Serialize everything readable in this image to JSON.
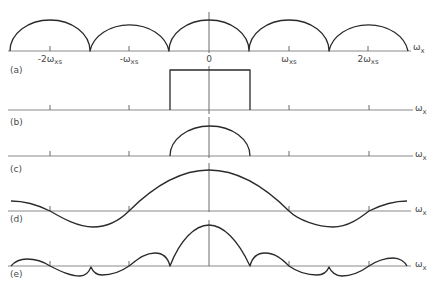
{
  "figure": {
    "background": "#ffffff",
    "line_color": "#2a2a2a",
    "axis_color": "#8a8a8a",
    "axis_label": {
      "main": "ω",
      "sub": "x"
    },
    "tick_labels": [
      {
        "main": "-2ω",
        "sub": "xs"
      },
      {
        "main": "-ω",
        "sub": "xs"
      },
      {
        "main": "0",
        "sub": ""
      },
      {
        "main": "ω",
        "sub": "xs"
      },
      {
        "main": "2ω",
        "sub": "xs"
      }
    ],
    "panels": [
      {
        "label": "(a)",
        "description": "periodic replicas of spectrum (semicircular lobes centered at multiples of ω_xs)",
        "curve": "M10,51 A40,31 0 0 1 90,51 A40,31 0 0 1 169,51 A40,31 0 0 1 249,51 A40,31 0 0 1 329,51 A40,31 0 0 1 408,51"
      },
      {
        "label": "(b)",
        "description": "ideal rectangular low-pass filter from -ω_xs/2 to ω_xs/2",
        "curve": "M170,110 L170,70 L250,70 L250,110"
      },
      {
        "label": "(c)",
        "description": "recovered baseband spectrum (single semicircular lobe)",
        "curve": "M170,156 A40,30 0 0 1 250,156"
      },
      {
        "label": "(d)",
        "description": "sinc-like interpolation filter response with zero crossings at multiples of ω_xs",
        "curve": "M11,201 C25,201 38,205 50,211 C62,218 78,227 93,227 C108,227 120,220 129,211 C152,188 178,170 209,170 C240,170 266,188 289,211 C298,220 318,227 333,227 C348,227 360,218 369,211 C381,205 394,201 407,201"
      },
      {
        "label": "(e)",
        "description": "product of (a) and (d): main lobe with aliased side lobes showing cusps",
        "curve": "M11,266 C16,260 21,259 27,259 C36,259 44,262 50,266 C60,271 70,276 80,276 C86,276 89,272 91,267 C93,272 96,275 102,275 C112,275 122,271 129,266 C138,259 145,253 155,253 C163,253 168,258 170,266 C180,240 195,225 209,225 C223,225 238,240 250,266 C252,258 257,253 265,253 C275,253 282,259 289,266 C296,271 306,275 317,275 C323,275 327,272 329,267 C331,272 336,276 342,276 C352,276 362,271 369,266 C376,261 386,258 393,258 C400,258 405,262 407,266"
      }
    ]
  }
}
